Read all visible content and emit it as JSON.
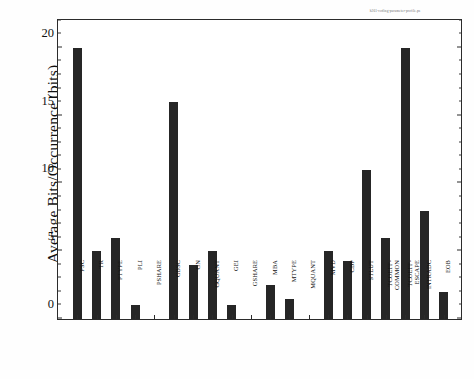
{
  "figure": {
    "header_annotation": "h261-coding-parameter-profile.ps",
    "background_color": "#ffffff",
    "frame_color": "#2b2b2b",
    "bar_color": "#262626"
  },
  "chart_data": {
    "type": "bar",
    "title": "",
    "xlabel": "",
    "ylabel": "Average Bits/Occurrence (bits)",
    "ylim": [
      0,
      22.2
    ],
    "yticks": [
      0,
      5,
      10,
      15,
      20
    ],
    "ytick_labels": [
      "0",
      "5",
      "10",
      "15",
      "20"
    ],
    "grid": false,
    "legend": null,
    "categories": [
      "PSC",
      "TR",
      "PTYPE",
      "PLI",
      "PSHARE",
      "GBSC",
      "GN",
      "GQUANT",
      "GEI",
      "GSHARE",
      "MBA",
      "MTYPE",
      "MQUANT",
      "MVD",
      "CBP",
      "STLUT",
      "TCOEFF-\nCOMMON",
      "TCOEFF-\nESCAPE",
      "INTRADC",
      "EOB"
    ],
    "values": [
      20,
      5,
      6,
      1,
      0,
      16,
      4,
      5,
      1,
      0,
      2.5,
      1.5,
      0,
      5,
      4.3,
      11,
      6,
      20,
      8,
      2
    ]
  }
}
